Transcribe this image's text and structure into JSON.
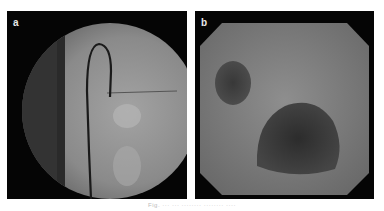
{
  "figure": {
    "panels": [
      {
        "label": "a",
        "content": "fluoroscopy-image",
        "description": "circular fluoroscopic field with spine on left and looped catheter/guidewire"
      },
      {
        "label": "b",
        "content": "endoscopy-image",
        "description": "octagonal endoscopic view with two dark luminal openings"
      }
    ],
    "caption": "Fig. ··· ··· ········ ········ ····"
  },
  "colors": {
    "background": "#ffffff",
    "panel_bg": "#050505",
    "fluoro_field": "#8a8a8a",
    "endo_field": "#7c7c7c"
  }
}
